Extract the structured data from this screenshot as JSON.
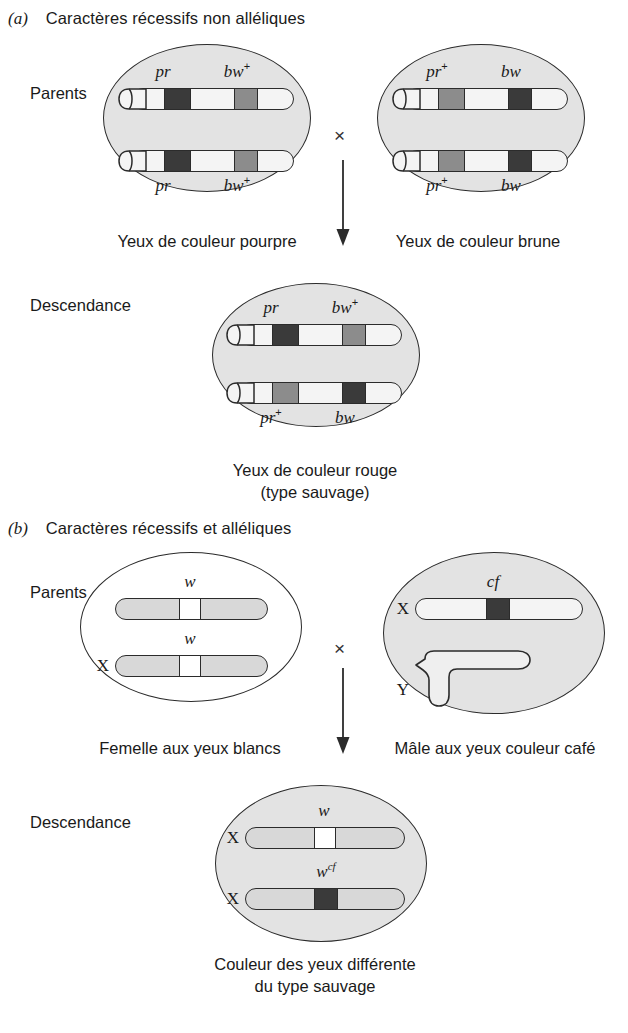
{
  "panels": [
    {
      "letter": "(a)",
      "title": "Caractères récessifs non alléliques",
      "row_labels": {
        "parents": "Parents",
        "offspring": "Descendance"
      },
      "cross_symbol": "×",
      "parents": [
        {
          "caption": "Yeux de couleur pourpre",
          "chromosomes": [
            {
              "top_label": "pr",
              "top_sup": "",
              "bottom_label": "",
              "bottom_sup": "",
              "band1": "dark",
              "band2": "mid"
            },
            {
              "top_label": "",
              "top_sup": "",
              "bottom_label": "pr",
              "bottom_sup": "",
              "band1": "dark",
              "band2": "mid"
            }
          ],
          "labels_top": [
            {
              "text": "pr",
              "sup": ""
            },
            {
              "text": "bw",
              "sup": "+"
            }
          ],
          "labels_bottom": [
            {
              "text": "pr",
              "sup": ""
            },
            {
              "text": "bw",
              "sup": "+"
            }
          ]
        },
        {
          "caption": "Yeux de couleur brune",
          "labels_top": [
            {
              "text": "pr",
              "sup": "+"
            },
            {
              "text": "bw",
              "sup": ""
            }
          ],
          "labels_bottom": [
            {
              "text": "pr",
              "sup": "+"
            },
            {
              "text": "bw",
              "sup": ""
            }
          ]
        }
      ],
      "offspring": {
        "caption_line1": "Yeux de couleur rouge",
        "caption_line2": "(type sauvage)",
        "labels_top": [
          {
            "text": "pr",
            "sup": ""
          },
          {
            "text": "bw",
            "sup": "+"
          }
        ],
        "labels_bottom": [
          {
            "text": "pr",
            "sup": "+"
          },
          {
            "text": "bw",
            "sup": ""
          }
        ]
      }
    },
    {
      "letter": "(b)",
      "title": "Caractères récessifs et alléliques",
      "row_labels": {
        "parents": "Parents",
        "offspring": "Descendance"
      },
      "cross_symbol": "×",
      "parents": [
        {
          "caption": "Femelle aux yeux blancs",
          "labels": [
            {
              "text": "w",
              "sup": ""
            },
            {
              "text": "w",
              "sup": ""
            }
          ],
          "chrom_labels": [
            "",
            "X"
          ]
        },
        {
          "caption": "Mâle aux yeux couleur café",
          "labels": [
            {
              "text": "cf",
              "sup": ""
            }
          ],
          "chrom_labels": [
            "X",
            "Y"
          ]
        }
      ],
      "offspring": {
        "caption_line1": "Couleur des yeux différente",
        "caption_line2": "du type sauvage",
        "labels": [
          {
            "text": "w",
            "sup": ""
          },
          {
            "text": "w",
            "sup": "cf"
          }
        ],
        "chrom_labels": [
          "X",
          "X"
        ]
      }
    }
  ],
  "colors": {
    "cell_fill": "#e3e3e3",
    "chromosome_fill": "#f4f4f4",
    "chromosome_gray_fill": "#d8d8d8",
    "band_mutant": "#3a3a3a",
    "band_wildtype": "#8c8c8c",
    "band_white": "#ffffff",
    "outline": "#2b2b2b"
  }
}
